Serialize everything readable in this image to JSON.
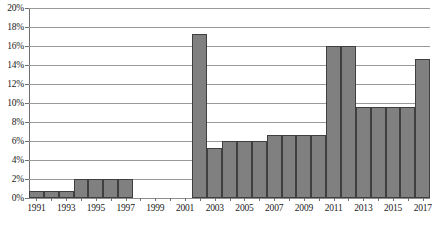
{
  "chart_data": {
    "type": "bar",
    "title": "",
    "subtitle": "",
    "xlabel": "",
    "ylabel": "",
    "ylim": [
      0,
      20
    ],
    "ytick_step": 2,
    "ytick_labels": [
      "20%",
      "18%",
      "16%",
      "14%",
      "12%",
      "10%",
      "8%",
      "6%",
      "4%",
      "2%",
      "0%"
    ],
    "ytick_values": [
      20,
      18,
      16,
      14,
      12,
      10,
      8,
      6,
      4,
      2,
      0
    ],
    "grid": true,
    "legend": false,
    "legend_position": "none",
    "bar_color": "#808080",
    "bar_border_color": "#3f3f3f",
    "grid_color": "#9a9a9a",
    "axis_color": "#6f6f6f",
    "unit": "%",
    "categories": [
      "1991",
      "1992",
      "1993",
      "1994",
      "1995",
      "1996",
      "1997",
      "1998",
      "1999",
      "2000",
      "2001",
      "2002",
      "2003",
      "2004",
      "2005",
      "2006",
      "2007",
      "2008",
      "2009",
      "2010",
      "2011",
      "2012",
      "2013",
      "2014",
      "2015",
      "2016",
      "2017"
    ],
    "xtick_labels": [
      "1991",
      "",
      "1993",
      "",
      "1995",
      "",
      "1997",
      "",
      "1999",
      "",
      "2001",
      "",
      "2003",
      "",
      "2005",
      "",
      "2007",
      "",
      "2009",
      "",
      "2011",
      "",
      "2013",
      "",
      "2015",
      "",
      "2017"
    ],
    "values": [
      0.7,
      0.7,
      0.7,
      2.0,
      2.0,
      2.0,
      2.0,
      0,
      0,
      0,
      0,
      17.3,
      5.3,
      6.0,
      6.0,
      6.0,
      6.6,
      6.6,
      6.6,
      6.6,
      16.0,
      16.0,
      9.6,
      9.6,
      9.6,
      9.6,
      14.6
    ]
  }
}
